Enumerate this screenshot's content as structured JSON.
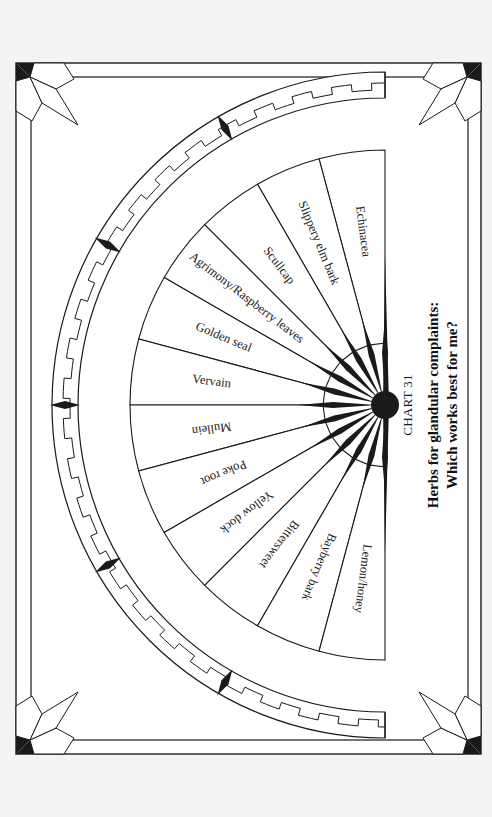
{
  "chart_data": {
    "type": "pie",
    "layout": "semicircle-wheel",
    "chart_number": "CHART 31",
    "title": "Herbs for glandular complaints:",
    "subtitle": "Which works best for me?",
    "segments": [
      "Echinacea",
      "Slippery elm bark",
      "Scullcap",
      "Agrimony/Raspberry leaves",
      "Golden seal",
      "Vervain",
      "Mullein",
      "Poke root",
      "Yellow dock",
      "Bittersweet",
      "Bayberry bark",
      "Lemon/honey"
    ],
    "values": [
      1,
      1,
      1,
      1,
      1,
      1,
      1,
      1,
      1,
      1,
      1,
      1
    ],
    "orientation": "rotated 90deg clockwise; flat edge on right"
  },
  "colors": {
    "background": "#f4f4f2",
    "ink": "#1a1a1a",
    "paper": "#ffffff"
  }
}
